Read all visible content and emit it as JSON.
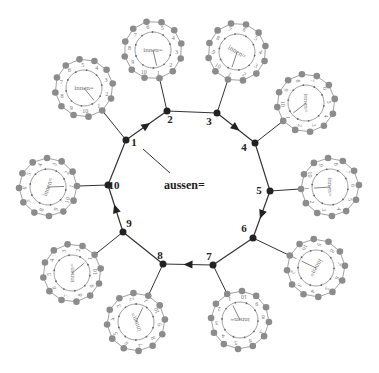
{
  "diagram": {
    "center_label": "aussen=",
    "satellite_label": "innen=",
    "colors": {
      "main_edge": "#333333",
      "main_node": "#222222",
      "satellite_edge": "#8a8a8a",
      "satellite_node": "#8c8c8c",
      "background": "#ffffff"
    },
    "main_nodes": [
      {
        "id": "1",
        "x": 126,
        "y": 140,
        "lx": 8,
        "ly": 6
      },
      {
        "id": "2",
        "x": 167,
        "y": 111,
        "lx": 3,
        "ly": 12
      },
      {
        "id": "3",
        "x": 217,
        "y": 113,
        "lx": -8,
        "ly": 12
      },
      {
        "id": "4",
        "x": 255,
        "y": 143,
        "lx": -11,
        "ly": 8
      },
      {
        "id": "5",
        "x": 270,
        "y": 191,
        "lx": -11,
        "ly": 3
      },
      {
        "id": "6",
        "x": 253,
        "y": 238,
        "lx": -9,
        "ly": -6
      },
      {
        "id": "7",
        "x": 213,
        "y": 265,
        "lx": -4,
        "ly": -5
      },
      {
        "id": "8",
        "x": 163,
        "y": 264,
        "lx": -3,
        "ly": -5
      },
      {
        "id": "9",
        "x": 123,
        "y": 232,
        "lx": 6,
        "ly": -5
      },
      {
        "id": "10",
        "x": 108,
        "y": 185,
        "lx": 6,
        "ly": 4
      }
    ],
    "arrows": [
      {
        "from": "1",
        "to": "2"
      },
      {
        "from": "3",
        "to": "4"
      },
      {
        "from": "5",
        "to": "6"
      },
      {
        "from": "7",
        "to": "8"
      },
      {
        "from": "9",
        "to": "10"
      }
    ],
    "center_pointer": {
      "x1": 143,
      "y1": 149,
      "x2": 170,
      "y2": 173
    },
    "center_label_pos": {
      "x": 164,
      "y": 189
    },
    "satellites": [
      {
        "attached_to": "1",
        "cx": 84,
        "cy": 88,
        "rotation": 0
      },
      {
        "attached_to": "2",
        "cx": 153,
        "cy": 50,
        "rotation": 0
      },
      {
        "attached_to": "3",
        "cx": 237,
        "cy": 52,
        "rotation": 30
      },
      {
        "attached_to": "4",
        "cx": 306,
        "cy": 103,
        "rotation": 90
      },
      {
        "attached_to": "5",
        "cx": 330,
        "cy": 187,
        "rotation": 90
      },
      {
        "attached_to": "6",
        "cx": 316,
        "cy": 268,
        "rotation": 120
      },
      {
        "attached_to": "7",
        "cx": 240,
        "cy": 320,
        "rotation": 180
      },
      {
        "attached_to": "8",
        "cx": 136,
        "cy": 322,
        "rotation": -110
      },
      {
        "attached_to": "9",
        "cx": 72,
        "cy": 273,
        "rotation": -90
      },
      {
        "attached_to": "10",
        "cx": 48,
        "cy": 187,
        "rotation": -70
      }
    ],
    "satellite_numbers": [
      "1",
      "2",
      "3",
      "4",
      "5",
      "6",
      "7",
      "8",
      "9",
      "10"
    ]
  }
}
